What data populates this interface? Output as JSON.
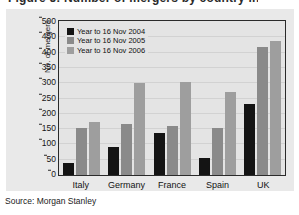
{
  "title": "Figure 5: Number of mergers by country in 2006",
  "source_note": "Source: Morgan Stanley",
  "chart_data": {
    "type": "bar",
    "title": "",
    "xlabel": "",
    "ylabel": "No. of mergers",
    "categories": [
      "Italy",
      "Germany",
      "France",
      "Spain",
      "UK"
    ],
    "series": [
      {
        "name": "Year to 16 Nov 2004",
        "color": "#141414",
        "values": [
          38,
          93,
          138,
          57,
          232
        ]
      },
      {
        "name": "Year to 16 Nov 2005",
        "color": "#8a8a8a",
        "values": [
          155,
          166,
          159,
          154,
          419
        ]
      },
      {
        "name": "Year to 16 Nov 2006",
        "color": "#9e9e9e",
        "values": [
          172,
          301,
          304,
          270,
          438
        ]
      }
    ],
    "ylim": [
      0,
      500
    ],
    "yticks": [
      0,
      50,
      100,
      150,
      200,
      250,
      300,
      350,
      400,
      450,
      500
    ],
    "grid": true,
    "legend_position": "top-left"
  },
  "colors": {
    "panel": "#e9e9e9",
    "plot_bg": "#e4e4e4",
    "frame": "#2a2a2a",
    "grid": "#d2d2d2"
  }
}
